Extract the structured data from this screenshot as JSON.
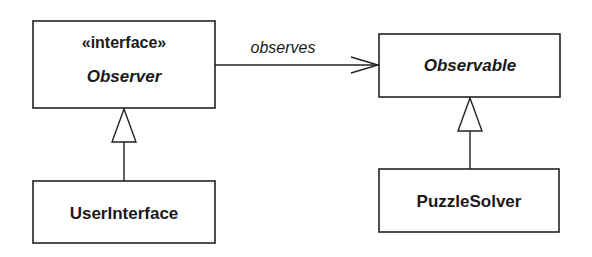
{
  "diagram": {
    "type": "UML class diagram",
    "classes": [
      {
        "id": "observer",
        "stereotype": "«interface»",
        "name": "Observer",
        "abstract": true
      },
      {
        "id": "observable",
        "stereotype": "",
        "name": "Observable",
        "abstract": true
      },
      {
        "id": "userinterface",
        "stereotype": "",
        "name": "UserInterface",
        "abstract": false
      },
      {
        "id": "puzzlesolver",
        "stereotype": "",
        "name": "PuzzleSolver",
        "abstract": false
      }
    ],
    "relationships": [
      {
        "from": "observer",
        "to": "observable",
        "type": "association",
        "label": "observes",
        "arrow": "open"
      },
      {
        "from": "userinterface",
        "to": "observer",
        "type": "realization/generalization",
        "arrow": "hollow-triangle"
      },
      {
        "from": "puzzlesolver",
        "to": "observable",
        "type": "generalization",
        "arrow": "hollow-triangle"
      }
    ]
  },
  "colors": {
    "stroke": "#222222",
    "text": "#1a1a1a",
    "background": "#ffffff"
  }
}
